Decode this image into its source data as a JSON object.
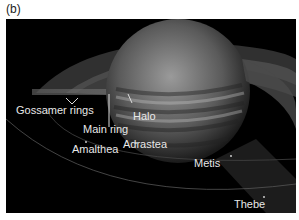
{
  "panel": {
    "label": "(b)"
  },
  "labels": {
    "gossamer": "Gossamer rings",
    "main_ring": "Main ring",
    "halo": "Halo",
    "amalthea": "Amalthea",
    "adrastea": "Adrastea",
    "metis": "Metis",
    "thebe": "Thebe"
  },
  "colors": {
    "background": "#000000",
    "label": "#e8e8e8"
  }
}
